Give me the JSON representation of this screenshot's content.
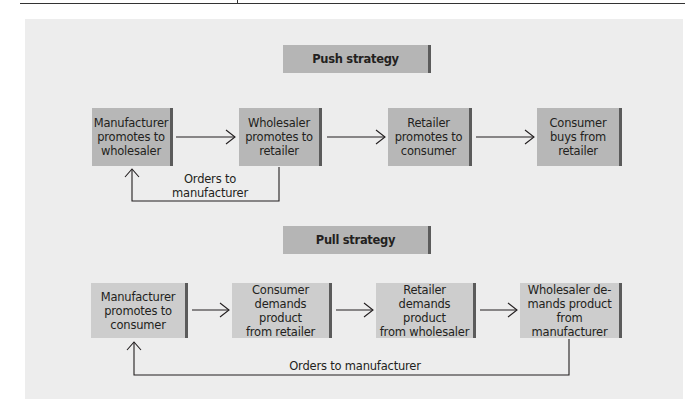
{
  "diagram": {
    "push": {
      "title": "Push strategy",
      "steps": [
        {
          "line1": "Manufacturer",
          "line2": "promotes to",
          "line3": "wholesaler"
        },
        {
          "line1": "Wholesaler",
          "line2": "promotes to",
          "line3": "retailer"
        },
        {
          "line1": "Retailer",
          "line2": "promotes to",
          "line3": "consumer"
        },
        {
          "line1": "Consumer",
          "line2": "buys from",
          "line3": "retailer"
        }
      ],
      "feedback": {
        "line1": "Orders to",
        "line2": "manufacturer"
      }
    },
    "pull": {
      "title": "Pull strategy",
      "steps": [
        {
          "line1": "Manufacturer",
          "line2": "promotes to",
          "line3": "consumer"
        },
        {
          "line1": "Consumer",
          "line2": "demands product",
          "line3": "from retailer"
        },
        {
          "line1": "Retailer",
          "line2": "demands product",
          "line3": "from wholesaler"
        },
        {
          "line1": "Wholesaler de-",
          "line2": "mands product",
          "line3": "from manufacturer"
        }
      ],
      "feedback": {
        "line1": "Orders to manufacturer"
      }
    }
  },
  "colors": {
    "panel": "#ededed",
    "push_box": "#b7b7b7",
    "pull_box": "#cdcdcd",
    "box_edge": "#5b5b5b",
    "line": "#231f20"
  }
}
